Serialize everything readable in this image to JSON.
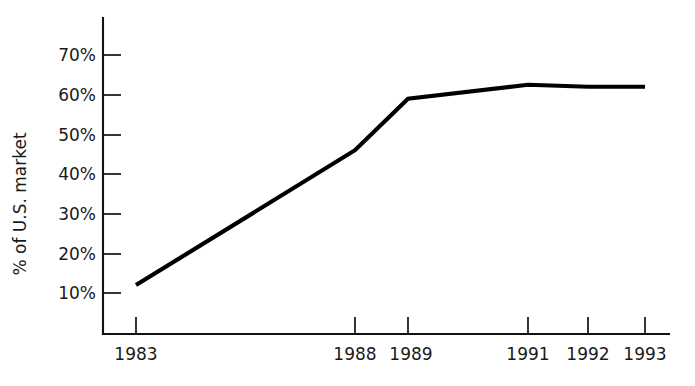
{
  "chart_data": {
    "type": "line",
    "title": "",
    "subtitle": "",
    "xlabel": "",
    "ylabel": "% of U.S. market",
    "x": [
      "1983",
      "1988",
      "1989",
      "1991",
      "1992",
      "1993"
    ],
    "values": [
      12,
      46,
      59,
      62.5,
      62,
      62
    ],
    "series": [
      {
        "name": "% of U.S. market",
        "values": [
          12,
          46,
          59,
          62.5,
          62,
          62
        ]
      }
    ],
    "y_tick_labels": [
      "70%",
      "60%",
      "50%",
      "40%",
      "30%",
      "20%",
      "10%"
    ],
    "y_tick_values": [
      70,
      60,
      50,
      40,
      30,
      20,
      10
    ],
    "x_tick_labels": [
      "1983",
      "1988",
      "1989",
      "1991",
      "1992",
      "1993"
    ],
    "ylim": [
      0,
      75
    ],
    "xlim": [
      1983,
      1993
    ],
    "grid": false,
    "legend": false,
    "legend_position": "none",
    "line_color": "#000000",
    "axis_color": "#111111",
    "background_color": "#ffffff",
    "annotations": []
  },
  "axis": {
    "y_title": "% of U.S. market",
    "ticks_y": [
      {
        "label": "70%",
        "value": 70
      },
      {
        "label": "60%",
        "value": 60
      },
      {
        "label": "50%",
        "value": 50
      },
      {
        "label": "40%",
        "value": 40
      },
      {
        "label": "30%",
        "value": 30
      },
      {
        "label": "20%",
        "value": 20
      },
      {
        "label": "10%",
        "value": 10
      }
    ],
    "ticks_x": [
      {
        "label": "1983",
        "value": 1983
      },
      {
        "label": "1988",
        "value": 1988
      },
      {
        "label": "1989",
        "value": 1989
      },
      {
        "label": "1991",
        "value": 1991
      },
      {
        "label": "1992",
        "value": 1992
      },
      {
        "label": "1993",
        "value": 1993
      }
    ]
  }
}
